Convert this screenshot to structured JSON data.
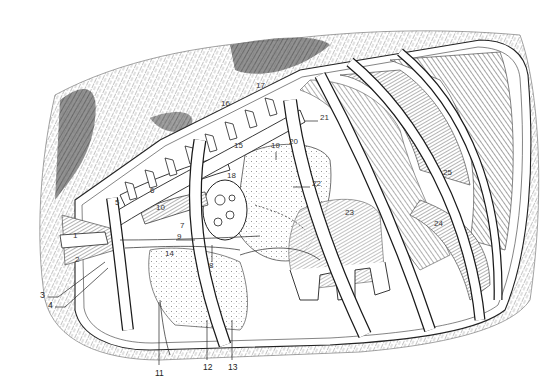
{
  "figure": {
    "colors": {
      "ink": "#1a1a1a",
      "fur": "#6b6b6b",
      "paper": "#ffffff"
    }
  },
  "labels": [
    {
      "n": "1",
      "x": 73,
      "y": 236,
      "outside": false
    },
    {
      "n": "2",
      "x": 75,
      "y": 260,
      "outside": false
    },
    {
      "n": "3",
      "x": 40,
      "y": 295,
      "outside": true
    },
    {
      "n": "4",
      "x": 48,
      "y": 305,
      "outside": true
    },
    {
      "n": "5",
      "x": 115,
      "y": 203,
      "outside": false
    },
    {
      "n": "6",
      "x": 150,
      "y": 191,
      "outside": false
    },
    {
      "n": "7",
      "x": 180,
      "y": 226,
      "outside": false
    },
    {
      "n": "8",
      "x": 209,
      "y": 266,
      "outside": false
    },
    {
      "n": "9",
      "x": 177,
      "y": 237,
      "outside": false
    },
    {
      "n": "10",
      "x": 156,
      "y": 208,
      "outside": false
    },
    {
      "n": "11",
      "x": 155,
      "y": 373,
      "outside": true
    },
    {
      "n": "12",
      "x": 203,
      "y": 367,
      "outside": true
    },
    {
      "n": "13",
      "x": 228,
      "y": 367,
      "outside": true
    },
    {
      "n": "14",
      "x": 165,
      "y": 254,
      "outside": false
    },
    {
      "n": "15",
      "x": 234,
      "y": 146,
      "outside": false
    },
    {
      "n": "16",
      "x": 221,
      "y": 104,
      "outside": false
    },
    {
      "n": "17",
      "x": 256,
      "y": 86,
      "outside": false
    },
    {
      "n": "18",
      "x": 227,
      "y": 176,
      "outside": false
    },
    {
      "n": "19",
      "x": 271,
      "y": 146,
      "outside": false
    },
    {
      "n": "20",
      "x": 289,
      "y": 142,
      "outside": false
    },
    {
      "n": "21",
      "x": 320,
      "y": 118,
      "outside": false
    },
    {
      "n": "22",
      "x": 312,
      "y": 184,
      "outside": false
    },
    {
      "n": "23",
      "x": 345,
      "y": 213,
      "outside": false
    },
    {
      "n": "24",
      "x": 434,
      "y": 224,
      "outside": false
    },
    {
      "n": "25",
      "x": 443,
      "y": 173,
      "outside": false
    }
  ]
}
